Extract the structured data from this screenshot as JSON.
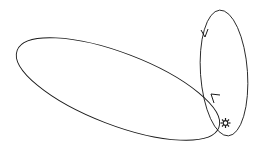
{
  "diagram": {
    "colors": {
      "background": "#ffffff",
      "stroke": "#1a1a1a"
    },
    "sun": {
      "symbol": "sun-icon",
      "cx": 226,
      "cy": 122
    },
    "orbits": [
      {
        "name": "large-orbit",
        "cx": 118,
        "cy": 89,
        "rx": 108,
        "ry": 37,
        "rotate": 20,
        "arrow": {
          "x": 216,
          "y": 97,
          "direction": "up-left"
        }
      },
      {
        "name": "vertical-orbit",
        "cx": 224,
        "cy": 73,
        "rx": 23,
        "ry": 63,
        "rotate": 0,
        "arrow": {
          "x": 205,
          "y": 36,
          "direction": "down"
        }
      }
    ]
  }
}
